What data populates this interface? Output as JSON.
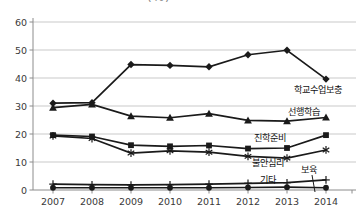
{
  "page": {
    "clipped_title_fragment": "(%)"
  },
  "chart_data": {
    "type": "line",
    "title": "",
    "xlabel": "",
    "ylabel": "",
    "x": [
      2007,
      2008,
      2009,
      2010,
      2011,
      2012,
      2013,
      2014
    ],
    "y_ticks": [
      0,
      10,
      20,
      30,
      40,
      50,
      60
    ],
    "ylim": [
      0,
      60
    ],
    "grid": "horizontal",
    "legend_position": "inline-annotations",
    "series": [
      {
        "name": "학교수업보충",
        "marker": "diamond",
        "values": [
          31.0,
          31.2,
          44.8,
          44.5,
          44.0,
          48.3,
          49.9,
          39.6
        ],
        "label_pos": [
          294,
          93
        ]
      },
      {
        "name": "선행학습",
        "marker": "triangle",
        "values": [
          29.4,
          30.6,
          26.4,
          25.8,
          27.3,
          24.9,
          24.6,
          25.9
        ],
        "label_pos": [
          288,
          115
        ]
      },
      {
        "name": "진학준비",
        "marker": "square",
        "values": [
          19.6,
          19.1,
          16.0,
          15.6,
          15.9,
          14.8,
          15.0,
          19.6
        ],
        "label_pos": [
          254,
          141
        ]
      },
      {
        "name": "불안심리",
        "marker": "asterisk",
        "values": [
          19.3,
          18.4,
          13.2,
          14.0,
          13.5,
          12.0,
          11.4,
          14.3
        ],
        "label_pos": [
          252,
          166
        ]
      },
      {
        "name": "기타",
        "marker": "plus",
        "values": [
          2.1,
          1.9,
          1.8,
          1.9,
          2.1,
          2.4,
          2.6,
          3.6
        ],
        "label_pos": [
          260,
          183
        ]
      },
      {
        "name": "보육",
        "marker": "circle",
        "values": [
          0.8,
          0.8,
          0.8,
          0.8,
          0.8,
          0.9,
          1.0,
          0.8
        ],
        "label_pos": [
          301,
          173
        ],
        "leader_line": [
          [
            312,
            175
          ],
          [
            315,
            192
          ]
        ]
      }
    ],
    "colors": {
      "series": "#1a1a1a",
      "grid": "#c9c9c9",
      "axis": "#8c8c8c",
      "tick_label": "#3a3a3a",
      "annotation": "#111111"
    }
  }
}
